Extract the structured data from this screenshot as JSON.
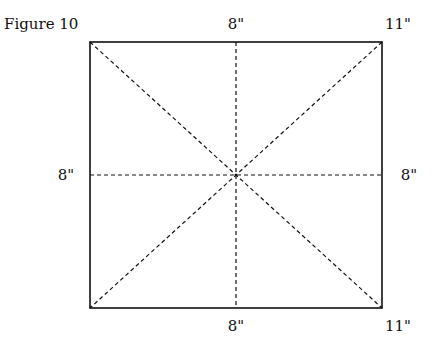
{
  "figure": {
    "title": "Figure 10",
    "labels": {
      "top_center": "8\"",
      "top_right": "11\"",
      "left_middle": "8\"",
      "right_middle": "8\"",
      "bottom_center": "8\"",
      "bottom_right": "11\""
    },
    "square": {
      "x": 90,
      "y": 42,
      "width": 292,
      "height": 266
    },
    "line_color": "#111111",
    "fold_lines": [
      "vertical-center",
      "horizontal-center",
      "diagonal-tl-br",
      "diagonal-tr-bl"
    ]
  }
}
